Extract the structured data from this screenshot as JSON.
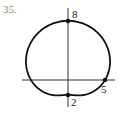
{
  "problem_number": "35.",
  "chart_data": {
    "type": "line",
    "subtype": "polar",
    "title": "",
    "equation": "r = 5 + 3 sin(theta)",
    "xlabel": "",
    "ylabel": "",
    "grid": false,
    "annotations": [
      {
        "label": "8",
        "r": 8,
        "theta_deg": 90
      },
      {
        "label": "5",
        "r": 5,
        "theta_deg": 0
      },
      {
        "label": "2",
        "r": 2,
        "theta_deg": 270
      }
    ],
    "points": [
      {
        "x": 0,
        "y": 8
      },
      {
        "x": 5,
        "y": 0
      },
      {
        "x": 0,
        "y": -2
      }
    ]
  },
  "labels": {
    "top": "8",
    "right": "5",
    "bottom": "2"
  },
  "style": {
    "curve_color": "#111111",
    "axis_color": "#333333"
  }
}
